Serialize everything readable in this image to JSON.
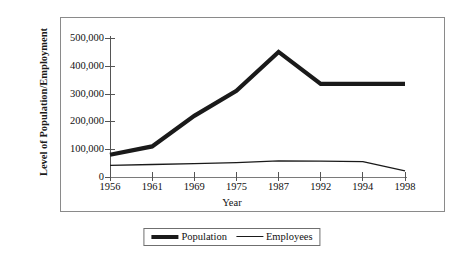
{
  "chart_data": {
    "type": "line",
    "title": "",
    "xlabel": "Year",
    "ylabel": "Level of Population/Employment",
    "categories": [
      "1956",
      "1961",
      "1969",
      "1975",
      "1987",
      "1992",
      "1994",
      "1998"
    ],
    "series": [
      {
        "name": "Population",
        "values": [
          80000,
          110000,
          220000,
          310000,
          450000,
          335000,
          335000,
          335000
        ],
        "style": "thick",
        "color": "#1a1a1a"
      },
      {
        "name": "Employees",
        "values": [
          42000,
          45000,
          48000,
          52000,
          58000,
          57000,
          55000,
          22000
        ],
        "style": "thin",
        "color": "#1a1a1a"
      }
    ],
    "ylim": [
      0,
      500000
    ],
    "ytick_labels": [
      "500,000",
      "400,000",
      "300,000",
      "200,000",
      "100,000",
      "0"
    ],
    "ytick_values": [
      500000,
      400000,
      300000,
      200000,
      100000,
      0
    ],
    "grid": false,
    "legend_position": "bottom"
  },
  "axes": {
    "y_title": "Level of Population/Employment",
    "x_title": "Year"
  },
  "legend": {
    "entries": [
      {
        "label": "Population",
        "swatch": "thick-line-swatch"
      },
      {
        "label": "Employees",
        "swatch": "thin-line-swatch"
      }
    ]
  }
}
